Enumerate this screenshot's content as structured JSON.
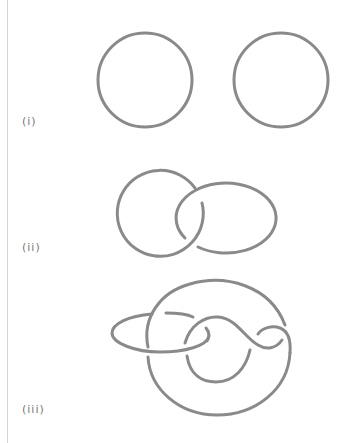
{
  "figures": [
    {
      "id": "i",
      "label": "(i)",
      "description": "two-component unlink: two separate circles"
    },
    {
      "id": "ii",
      "label": "(ii)",
      "description": "Hopf link: two linked loops"
    },
    {
      "id": "iii",
      "label": "(iii)",
      "description": "link diagram: large loop, ellipse and twisted inner strand"
    }
  ],
  "colors": {
    "stroke": "#8a8a8a",
    "label": "#777777",
    "rule": "#d4d4d4",
    "background": "#ffffff"
  }
}
